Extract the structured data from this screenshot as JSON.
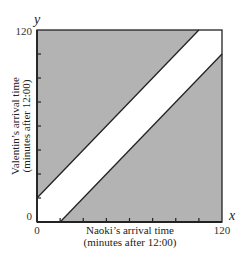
{
  "chart_data": {
    "type": "area",
    "title": "",
    "xlabel": "Naoki's arrival time (minutes after 12:00)",
    "xlabel_lines": [
      "Naoki’s arrival time",
      "(minutes after 12:00)"
    ],
    "ylabel": "Valentin's arrival time (minutes after 12:00)",
    "ylabel_lines": [
      "Valentin’s arrival time",
      "(minutes after 12:00)"
    ],
    "x_var": "x",
    "y_var": "y",
    "xlim": [
      0,
      120
    ],
    "ylim": [
      0,
      120
    ],
    "x_tick_labels": [
      "0",
      "120"
    ],
    "y_tick_labels": [
      "0",
      "120"
    ],
    "tick_interval": 15,
    "band_width": 15,
    "regions": [
      {
        "name": "meet-region",
        "condition": "|x - y| <= 15",
        "fill": "#ffffff"
      },
      {
        "name": "upper-shaded",
        "condition": "y - x > 15",
        "fill": "#b3b3b3"
      },
      {
        "name": "lower-shaded",
        "condition": "x - y > 15",
        "fill": "#b3b3b3"
      }
    ],
    "lines": [
      {
        "name": "upper-boundary",
        "equation": "y = x + 15",
        "points": [
          [
            0,
            15
          ],
          [
            105,
            120
          ]
        ]
      },
      {
        "name": "lower-boundary",
        "equation": "y = x - 15",
        "points": [
          [
            15,
            0
          ],
          [
            120,
            105
          ]
        ]
      }
    ],
    "grid": false,
    "legend": null
  },
  "colors": {
    "shade": "#b3b3b3",
    "band": "#ffffff",
    "line": "#222222"
  }
}
